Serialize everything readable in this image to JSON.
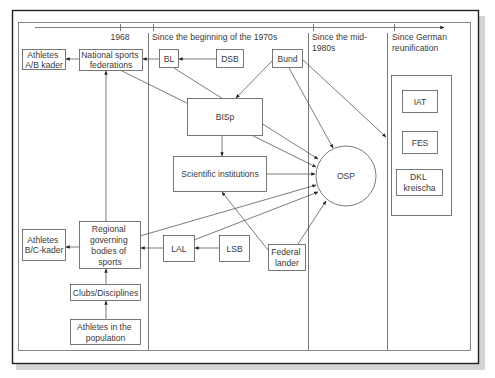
{
  "timeline": {
    "periods": [
      {
        "id": "p1968",
        "lines": [
          "1968"
        ]
      },
      {
        "id": "p1970s",
        "lines": [
          "Since the beginning of the 1970s"
        ]
      },
      {
        "id": "p1980s",
        "lines": [
          "Since the mid-",
          "1980s"
        ]
      },
      {
        "id": "preunif",
        "lines": [
          "Since German",
          "reunification"
        ]
      }
    ]
  },
  "nodes": {
    "athletes_ab": {
      "lines": [
        "Athletes",
        "A/B kader"
      ]
    },
    "national_federations": {
      "lines": [
        "National sports",
        "federations"
      ]
    },
    "bl": {
      "lines": [
        "BL"
      ]
    },
    "dsb": {
      "lines": [
        "DSB"
      ]
    },
    "bund": {
      "lines": [
        "Bund"
      ]
    },
    "bisp": {
      "lines": [
        "BISp"
      ]
    },
    "scientific_institutions": {
      "lines": [
        "Scientific institutions"
      ]
    },
    "osp": {
      "lines": [
        "OSP"
      ]
    },
    "iat": {
      "lines": [
        "IAT"
      ]
    },
    "fes": {
      "lines": [
        "FES"
      ]
    },
    "dkl": {
      "lines": [
        "DKL",
        "kreischa"
      ]
    },
    "athletes_bc": {
      "lines": [
        "Athletes",
        "B/C-kader"
      ]
    },
    "regional_bodies": {
      "lines": [
        "Regional",
        "governing",
        "bodies of",
        "sports"
      ]
    },
    "lal": {
      "lines": [
        "LAL"
      ]
    },
    "lsb": {
      "lines": [
        "LSB"
      ]
    },
    "federal_lander": {
      "lines": [
        "Federal",
        "lander"
      ]
    },
    "clubs": {
      "lines": [
        "Clubs/Disciplines"
      ]
    },
    "athletes_population": {
      "lines": [
        "Athletes in the",
        "population"
      ]
    }
  },
  "edges": [
    {
      "from": "national_federations",
      "to": "athletes_ab"
    },
    {
      "from": "bl",
      "to": "national_federations"
    },
    {
      "from": "dsb",
      "to": "bl"
    },
    {
      "from": "bund",
      "to": "bisp"
    },
    {
      "from": "bund",
      "to": "osp"
    },
    {
      "from": "bund",
      "to": "preunification_column"
    },
    {
      "from": "bl",
      "to": "osp"
    },
    {
      "from": "national_federations",
      "to": "osp"
    },
    {
      "from": "bisp",
      "to": "scientific_institutions"
    },
    {
      "from": "scientific_institutions",
      "to": "osp"
    },
    {
      "from": "regional_bodies",
      "to": "osp"
    },
    {
      "from": "lal",
      "to": "osp"
    },
    {
      "from": "federal_lander",
      "to": "osp"
    },
    {
      "from": "federal_lander",
      "to": "scientific_institutions"
    },
    {
      "from": "lsb",
      "to": "lal"
    },
    {
      "from": "lal",
      "to": "regional_bodies"
    },
    {
      "from": "regional_bodies",
      "to": "athletes_bc"
    },
    {
      "from": "regional_bodies",
      "to": "national_federations"
    },
    {
      "from": "clubs",
      "to": "regional_bodies"
    },
    {
      "from": "athletes_population",
      "to": "clubs"
    }
  ]
}
